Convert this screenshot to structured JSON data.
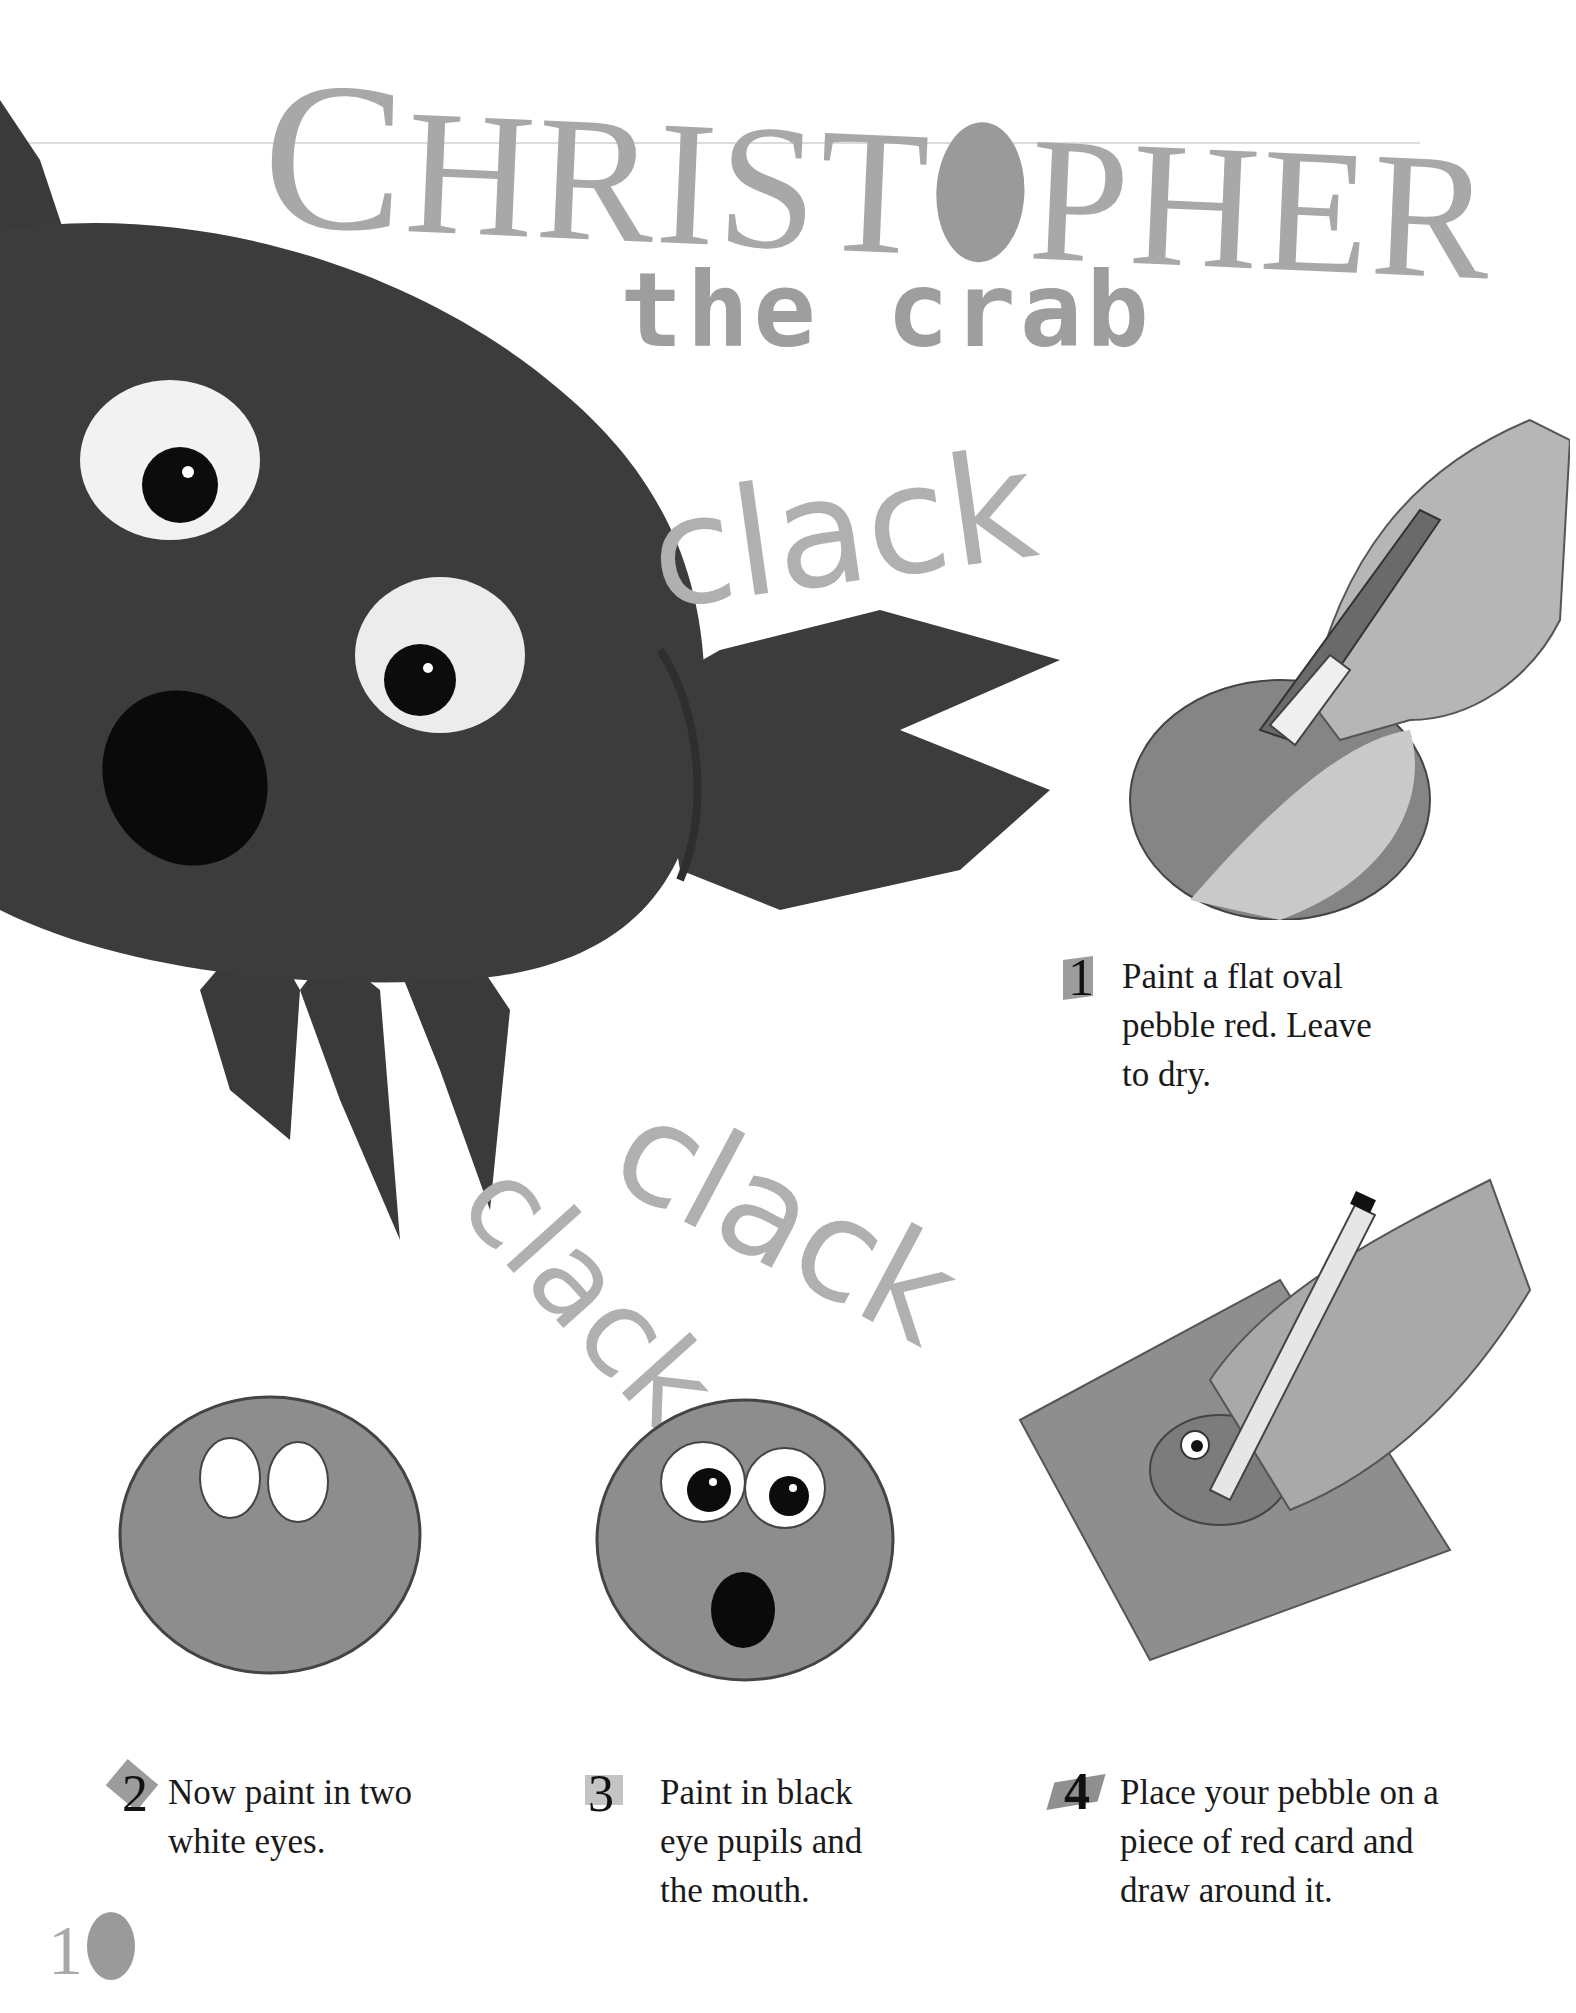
{
  "title": {
    "main_first": "C",
    "main_rest_1": "HRIST",
    "main_rest_2": "PHER",
    "subtitle": "the crab"
  },
  "sound_words": [
    "clack",
    "clack",
    "clack"
  ],
  "steps": [
    {
      "number": "1",
      "text_lines": [
        "Paint a flat oval",
        "pebble red. Leave",
        "to dry."
      ]
    },
    {
      "number": "2",
      "text_lines": [
        "Now paint in two",
        "white eyes."
      ]
    },
    {
      "number": "3",
      "text_lines": [
        "Paint in black",
        "eye pupils and",
        "the mouth."
      ]
    },
    {
      "number": "4",
      "text_lines": [
        "Place your pebble on a",
        "piece of red card and",
        "draw around it."
      ]
    }
  ],
  "page_number": {
    "digit": "1",
    "circle_digit": "0"
  },
  "colors": {
    "crab_body": "#3c3c3c",
    "pebble": "#8a8a8a",
    "title_gray": "#a8a8a8",
    "clack_gray": "#b0b0b0"
  }
}
